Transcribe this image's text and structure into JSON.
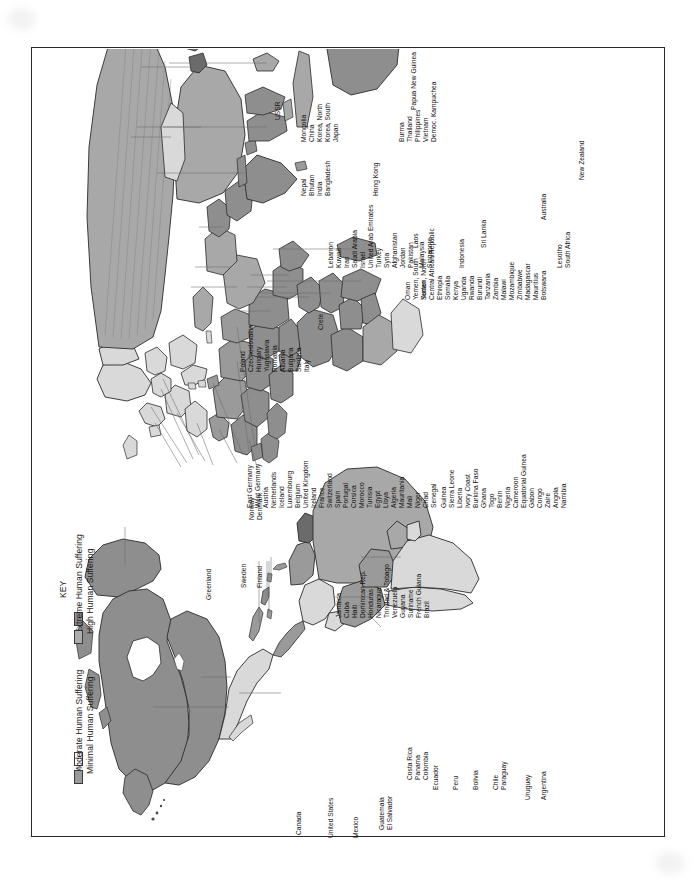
{
  "page": {
    "orientation": "landscape-rotated-90",
    "background": "#ffffff",
    "border_color": "#2a2a2a"
  },
  "legend": {
    "title": "KEY",
    "items": [
      {
        "label": "Extreme Human Suffering",
        "color": "#8e8e8e",
        "swatch": "extreme"
      },
      {
        "label": "High Human Suffering",
        "color": "#adadad",
        "swatch": "high"
      },
      {
        "label": "Moderate Human Suffering",
        "color": "#ffffff",
        "swatch": "moderate"
      },
      {
        "label": "Minimal Human Suffering",
        "color": "#9a9a9a",
        "swatch": "minimal"
      },
      {
        "label": "No Data",
        "color": "#6b6b6b",
        "swatch": "nodata"
      }
    ]
  },
  "map": {
    "ocean_color": "#ffffff",
    "outline_color": "#2b2b2b",
    "fills": {
      "extreme": "#8e8e8e",
      "high": "#a8a8a8",
      "moderate": "#ffffff",
      "minimal": "#9a9a9a",
      "nodata": "#6b6b6b",
      "light": "#d9d9d9"
    },
    "labels_north_america": [
      "Canada",
      "United States",
      "Greenland",
      "Mexico"
    ],
    "labels_caribbean_central_america": [
      "Jamaica",
      "Cuba",
      "Haiti",
      "Dominican Rep.",
      "Honduras",
      "Nicaragua",
      "Trinidad & Tobago",
      "Venezuela",
      "Guyana",
      "Suriname",
      "French Guiana",
      "Brazil",
      "Guatemala",
      "El Salvador",
      "Costa Rica",
      "Panama",
      "Colombia"
    ],
    "labels_south_america": [
      "Ecuador",
      "Peru",
      "Bolivia",
      "Chile",
      "Paraguay",
      "Uruguay",
      "Argentina"
    ],
    "labels_europe": [
      "Sweden",
      "Finland",
      "Norway",
      "Denmark",
      "East Germany",
      "West Germany",
      "Austria",
      "Netherlands",
      "Iceland",
      "Luxembourg",
      "Belgium",
      "United Kingdom",
      "Ireland",
      "France",
      "Switzerland",
      "Spain",
      "Portugal",
      "Corsica",
      "Poland",
      "Czechoslovakia",
      "Hungary",
      "Yugoslavia",
      "Romania",
      "Albania",
      "Bulgaria",
      "Sardinia",
      "Italy",
      "Crete",
      "USSR"
    ],
    "labels_north_africa": [
      "Morocco",
      "Tunisia",
      "Egypt",
      "Libya",
      "Algeria",
      "Mauritania",
      "Mali",
      "Niger",
      "Chad",
      "Senegal"
    ],
    "labels_west_central_africa": [
      "Guinea",
      "Sierra Leone",
      "Liberia",
      "Ivory Coast",
      "Burkina Faso",
      "Ghana",
      "Togo",
      "Benin",
      "Nigeria",
      "Cameroon",
      "Equatorial Guinea",
      "Gabon",
      "Congo",
      "Zaire",
      "Angola",
      "Namibia"
    ],
    "labels_east_southern_africa": [
      "Sudan",
      "Central African Republic",
      "Ethiopia",
      "Somalia",
      "Kenya",
      "Uganda",
      "Rwanda",
      "Burundi",
      "Tanzania",
      "Zambia",
      "Malawi",
      "Mozambique",
      "Zimbabwe",
      "Madagascar",
      "Mauritius",
      "Botswana",
      "Lesotho",
      "South Africa"
    ],
    "labels_middle_east": [
      "Kuwait",
      "Iran",
      "Saudi Arabia",
      "Israel",
      "United Arab Emirates",
      "Turkey",
      "Syria",
      "Afghanistan",
      "Jordan",
      "Pakistan",
      "Lebanon",
      "Oman",
      "Yemen, South",
      "Yemen, North"
    ],
    "labels_asia": [
      "Mongolia",
      "China",
      "Korea, North",
      "Korea, South",
      "Japan",
      "Nepal",
      "Bhutan",
      "India",
      "Bangladesh",
      "Hong Kong",
      "Burma",
      "Thailand",
      "Philippines",
      "Vietnam",
      "Democ. Kampuchea",
      "Laos",
      "Sri Lanka",
      "Malaysia",
      "Singapore",
      "Indonesia"
    ],
    "labels_oceania": [
      "Papua New Guinea",
      "Australia",
      "New Zealand"
    ]
  }
}
